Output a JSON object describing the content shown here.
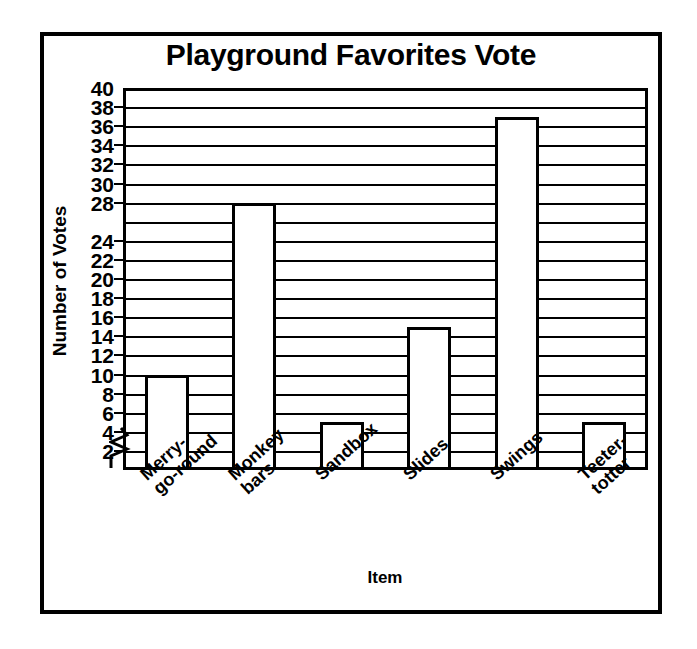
{
  "chart_data": {
    "type": "bar",
    "title": "Playground Favorites Vote",
    "xlabel": "Item",
    "ylabel": "Number of Votes",
    "categories": [
      "Merry-go-round",
      "Monkey bars",
      "Sandbox",
      "Slides",
      "Swings",
      "Teeter-totter"
    ],
    "category_lines": [
      [
        "Merry-",
        "go-round"
      ],
      [
        "Monkey",
        "bars"
      ],
      [
        "Sandbox"
      ],
      [
        "Slides"
      ],
      [
        "Swings"
      ],
      [
        "Teeter-",
        "totter"
      ]
    ],
    "values": [
      10,
      28,
      5,
      15,
      37,
      5
    ],
    "ylim": [
      0,
      40
    ],
    "ytick_step": 2,
    "ytick_values": [
      40,
      38,
      36,
      34,
      32,
      30,
      28,
      26,
      24,
      22,
      20,
      18,
      16,
      14,
      12,
      10,
      8,
      6,
      4,
      2
    ],
    "ytick_labels": [
      "40",
      "38",
      "36",
      "34",
      "32",
      "30",
      "28",
      "",
      "24",
      "22",
      "20",
      "18",
      "16",
      "14",
      "12",
      "10",
      "8",
      "6",
      "4",
      "2"
    ],
    "grid": true,
    "legend": false,
    "axis_break_at": 2,
    "colors": {
      "bar_fill": "#ffffff",
      "bar_stroke": "#000000",
      "grid": "#000000",
      "text": "#000000",
      "background": "#ffffff"
    }
  }
}
